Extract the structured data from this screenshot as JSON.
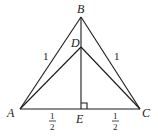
{
  "diagram": {
    "points": {
      "A": {
        "label": "A",
        "x": 20,
        "y": 109
      },
      "B": {
        "label": "B",
        "x": 81,
        "y": 17
      },
      "C": {
        "label": "C",
        "x": 140,
        "y": 109
      },
      "D": {
        "label": "D",
        "x": 81,
        "y": 47
      },
      "E": {
        "label": "E",
        "x": 81,
        "y": 109
      }
    },
    "edge_labels": {
      "AB": "1",
      "BC": "1",
      "AE_num": "1",
      "AE_den": "2",
      "EC_num": "1",
      "EC_den": "2"
    },
    "right_angle_at": "E",
    "stroke_color": "#1a1a1a"
  }
}
